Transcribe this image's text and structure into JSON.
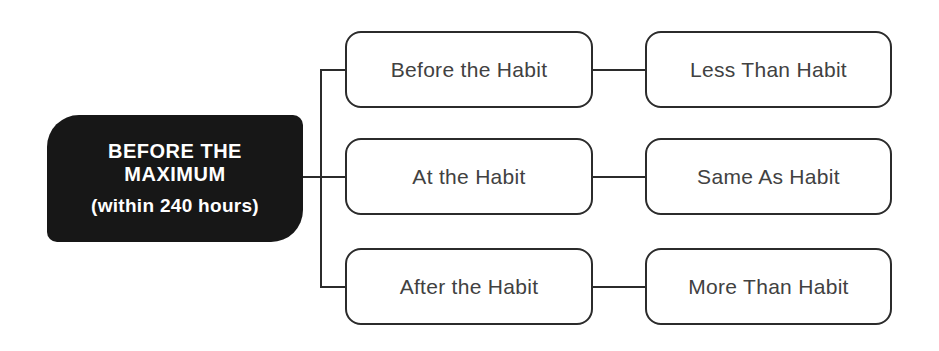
{
  "diagram": {
    "root": {
      "title_line1": "BEFORE THE",
      "title_line2": "MAXIMUM",
      "subtitle": "(within 240 hours)"
    },
    "rows": [
      {
        "condition": "Before the Habit",
        "result": "Less Than Habit"
      },
      {
        "condition": "At the Habit",
        "result": "Same As Habit"
      },
      {
        "condition": "After the Habit",
        "result": "More Than Habit"
      }
    ],
    "colors": {
      "background": "#ffffff",
      "root_bg": "#171717",
      "root_text": "#ffffff",
      "box_border": "#2b2b2b",
      "box_text": "#414141",
      "connector": "#2b2b2b"
    }
  }
}
